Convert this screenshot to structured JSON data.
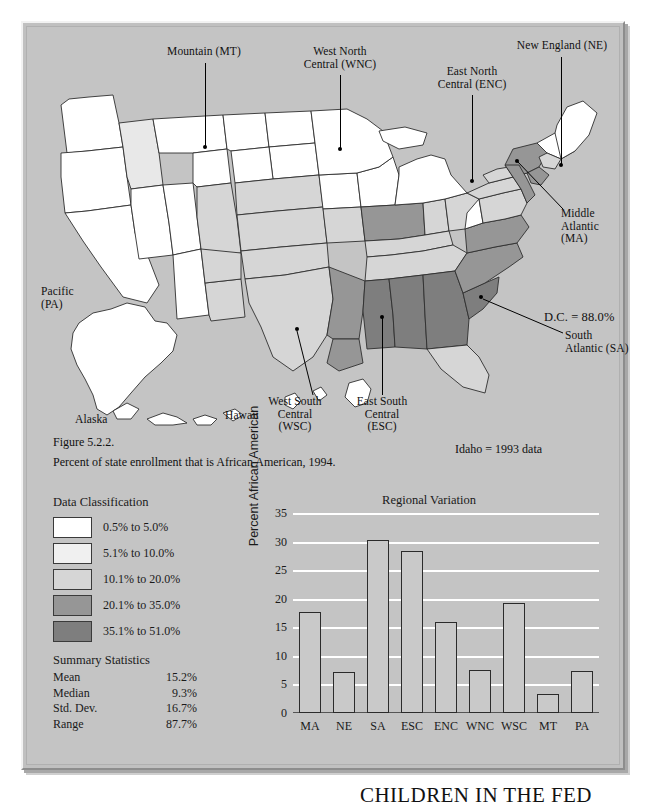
{
  "figure": {
    "number_label": "Figure 5.2.2.",
    "caption": "Percent of state enrollment that is African American, 1994.",
    "note_idaho": "Idaho = 1993 data",
    "note_dc": "D.C. = 88.0%"
  },
  "map": {
    "annotations": [
      {
        "id": "mountain",
        "text": "Mountain (MT)"
      },
      {
        "id": "west-north-central",
        "text": "West North\nCentral (WNC)"
      },
      {
        "id": "east-north-central",
        "text": "East North\nCentral (ENC)"
      },
      {
        "id": "new-england",
        "text": "New England (NE)"
      },
      {
        "id": "middle-atlantic",
        "text": "Middle\nAtlantic\n(MA)"
      },
      {
        "id": "south-atlantic",
        "text": "South\nAtlantic (SA)"
      },
      {
        "id": "east-south-central",
        "text": "East South\nCentral\n(ESC)"
      },
      {
        "id": "west-south-central",
        "text": "West South\nCentral\n(WSC)"
      },
      {
        "id": "pacific",
        "text": "Pacific\n(PA)"
      }
    ],
    "inset_labels": [
      {
        "id": "alaska",
        "text": "Alaska"
      },
      {
        "id": "hawaii",
        "text": "Hawaii"
      }
    ]
  },
  "legend": {
    "title": "Data Classification",
    "classes": [
      {
        "label": "0.5% to 5.0%",
        "color": "#ffffff"
      },
      {
        "label": "5.1% to 10.0%",
        "color": "#f0f0f0"
      },
      {
        "label": "10.1% to 20.0%",
        "color": "#d6d6d6"
      },
      {
        "label": "20.1% to 35.0%",
        "color": "#969696"
      },
      {
        "label": "35.1% to 51.0%",
        "color": "#7e7e7e"
      }
    ]
  },
  "summary": {
    "title": "Summary Statistics",
    "rows": [
      {
        "key": "Mean",
        "value": "15.2%"
      },
      {
        "key": "Median",
        "value": "9.3%"
      },
      {
        "key": "Std. Dev.",
        "value": "16.7%"
      },
      {
        "key": "Range",
        "value": "87.7%"
      }
    ]
  },
  "chart_data": {
    "type": "bar",
    "title": "Regional Variation",
    "xlabel": "",
    "ylabel": "Percent African American",
    "categories": [
      "MA",
      "NE",
      "SA",
      "ESC",
      "ENC",
      "WNC",
      "WSC",
      "MT",
      "PA"
    ],
    "values": [
      17.7,
      7.2,
      30.3,
      28.3,
      15.9,
      7.6,
      19.3,
      3.4,
      7.4
    ],
    "ylim": [
      0,
      35
    ],
    "yticks": [
      0,
      5,
      10,
      15,
      20,
      25,
      30,
      35
    ],
    "grid": true,
    "legend_position": "none",
    "bar_fill": "#c9c9c9",
    "bar_stroke": "#2b2b2b"
  },
  "footer": {
    "running_head": "CHILDREN IN THE FED"
  }
}
